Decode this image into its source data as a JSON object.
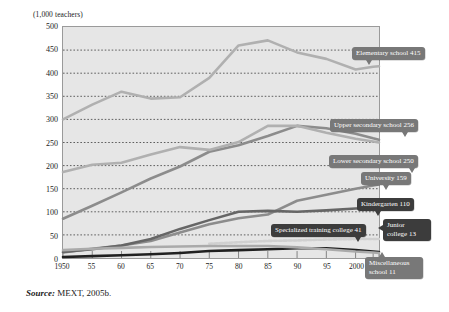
{
  "figure": {
    "y_axis_title": "(1,000 teachers)",
    "source_prefix": "Source:",
    "source_text": "MEXT, 2005b."
  },
  "chart_data": {
    "type": "line",
    "title": "",
    "xlabel": "(FY)",
    "ylabel": "(1,000 teachers)",
    "ylim": [
      0,
      500
    ],
    "ytick_values": [
      0,
      50,
      100,
      150,
      200,
      250,
      300,
      350,
      400,
      450,
      500
    ],
    "ytick_labels": [
      "0",
      "50",
      "100",
      "150",
      "200",
      "250",
      "300",
      "350",
      "400",
      "450",
      "500"
    ],
    "grid": true,
    "grid_style": "dotted-horizontal",
    "legend": "inline-callouts",
    "x_tick_labels": [
      "1950",
      "55",
      "60",
      "65",
      "70",
      "75",
      "80",
      "85",
      "90",
      "95",
      "2000",
      "03",
      "04 (FY)"
    ],
    "x": [
      1950,
      1955,
      1960,
      1965,
      1970,
      1975,
      1980,
      1985,
      1990,
      1995,
      2000,
      2003,
      2004
    ],
    "series": [
      {
        "name": "Elementary school",
        "end_value": 415,
        "label": "Elementary school  415",
        "color": "#b0b0b0",
        "values": [
          300,
          332,
          360,
          345,
          348,
          390,
          460,
          471,
          445,
          431,
          408,
          414,
          415
        ]
      },
      {
        "name": "Upper secondary school",
        "end_value": 256,
        "label": "Upper secondary school  256",
        "color": "#8c8c8c",
        "values": [
          85,
          113,
          142,
          172,
          198,
          230,
          244,
          264,
          286,
          281,
          269,
          259,
          256
        ]
      },
      {
        "name": "Lower secondary school",
        "end_value": 250,
        "label": "Lower secondary school  250",
        "color": "#b0b0b0",
        "values": [
          186,
          202,
          206,
          224,
          240,
          234,
          251,
          286,
          286,
          271,
          258,
          252,
          250
        ]
      },
      {
        "name": "University",
        "end_value": 159,
        "label": "University  159",
        "color": "#8c8c8c",
        "values": [
          12,
          20,
          27,
          37,
          55,
          73,
          86,
          94,
          124,
          137,
          150,
          157,
          159
        ]
      },
      {
        "name": "Kindergarten",
        "end_value": 110,
        "label": "Kindergarten  110",
        "color": "#666666",
        "values": [
          13,
          19,
          27,
          41,
          63,
          82,
          100,
          102,
          100,
          103,
          107,
          109,
          110
        ]
      },
      {
        "name": "Specialized training college",
        "end_value": 41,
        "label": "Specialized training college  41",
        "color": "#d0d0d0",
        "values": [
          null,
          null,
          null,
          null,
          null,
          31,
          34,
          37,
          38,
          40,
          41,
          41,
          41
        ]
      },
      {
        "name": "Junior college",
        "end_value": 13,
        "label_line1": "Junior",
        "label_line2": "college  13",
        "color": "#202020",
        "values": [
          2,
          4,
          6,
          8,
          11,
          15,
          17,
          19,
          21,
          21,
          17,
          14,
          13
        ]
      },
      {
        "name": "Miscellaneous school",
        "end_value": 11,
        "label_line1": "Miscellaneous",
        "label_line2": "school  11",
        "color": "#aaaaaa",
        "values": [
          17,
          20,
          22,
          24,
          25,
          26,
          26,
          26,
          23,
          19,
          14,
          12,
          11
        ]
      }
    ]
  }
}
